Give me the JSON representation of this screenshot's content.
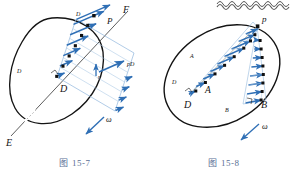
{
  "page": {
    "background_color": "#ffffff",
    "ink_color": "#1a1a1a",
    "vector_color": "#2f6fb5",
    "caption_color": "#5a6f95",
    "scan_artifact": "wavy-line-top-right"
  },
  "figures": [
    {
      "id": "fig-15-7",
      "caption_prefix": "图",
      "caption_number": "15-7",
      "body_shape": "egg-shaped-closed-curve",
      "rotation_symbol": "ω",
      "points": [
        {
          "name": "D",
          "label": "D",
          "role": "pole-point"
        },
        {
          "name": "P",
          "label": "P",
          "role": "moving-point"
        },
        {
          "name": "E",
          "label": "E",
          "role": "line-end-lower"
        },
        {
          "name": "F",
          "label": "F",
          "role": "line-end-upper"
        }
      ],
      "vectors": [
        {
          "name": "v_D_top",
          "label_main": "v",
          "label_sub": "D",
          "position": "top"
        },
        {
          "name": "v_D_left",
          "label_main": "v",
          "label_sub": "D",
          "position": "left"
        },
        {
          "name": "v_pD",
          "label_main": "v",
          "label_sub": "pD",
          "position": "right"
        },
        {
          "name": "v_r",
          "label_main": "v",
          "label_sub": "r",
          "position": "center-right"
        }
      ],
      "line_label": "EF",
      "vector_row_count": 7
    },
    {
      "id": "fig-15-8",
      "caption_prefix": "图",
      "caption_number": "15-8",
      "body_shape": "tilted-ellipse-closed-curve",
      "rotation_symbol": "ω",
      "points": [
        {
          "name": "D",
          "label": "D",
          "role": "pole-point-left"
        },
        {
          "name": "A",
          "label": "A",
          "role": "interior-point"
        },
        {
          "name": "B",
          "label": "B",
          "role": "pole-point-right"
        },
        {
          "name": "p",
          "label": "p",
          "role": "moving-point-top"
        }
      ],
      "vectors": [
        {
          "name": "v_A",
          "label_main": "v",
          "label_sub": "A",
          "position": "upper-left"
        },
        {
          "name": "v_D",
          "label_main": "v",
          "label_sub": "D",
          "position": "lower-left"
        },
        {
          "name": "v_B",
          "label_main": "v",
          "label_sub": "B",
          "position": "lower-right"
        }
      ],
      "vector_row_count_left": 8,
      "vector_row_count_right": 8
    }
  ]
}
